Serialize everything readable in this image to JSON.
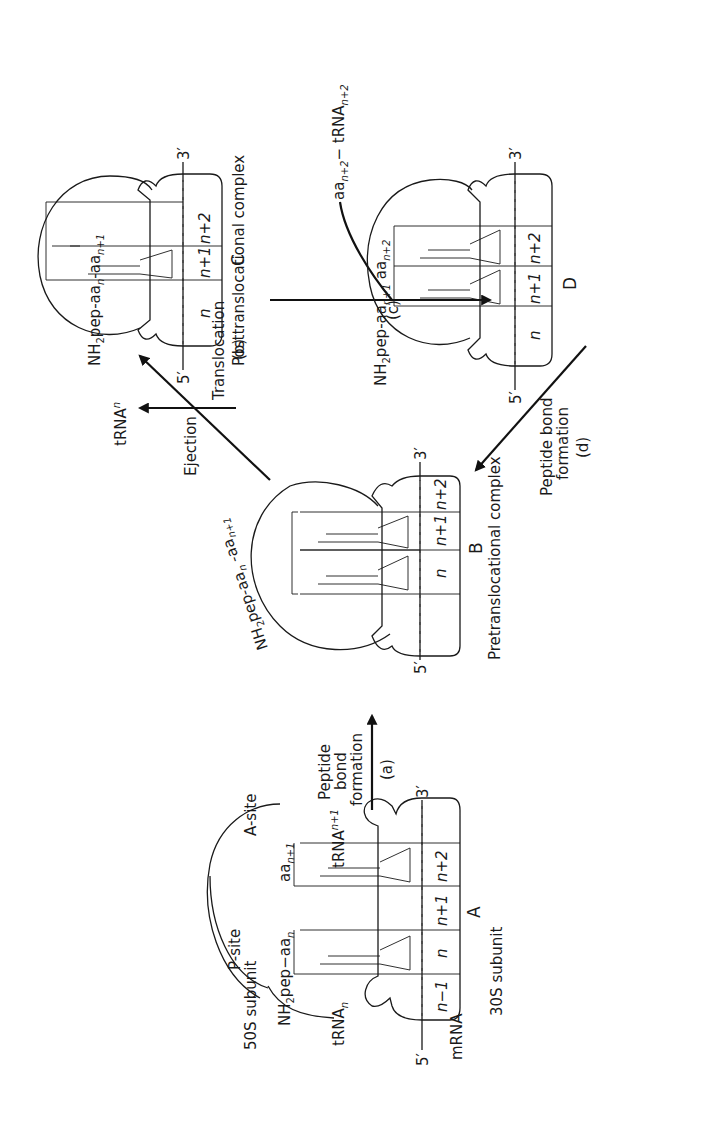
{
  "figure": {
    "orientation": "rotated 90 degrees counterclockwise"
  },
  "complex_a": {
    "id": "A",
    "subunit_large": "50S subunit",
    "subunit_small": "30S subunit",
    "p_site": "P-site",
    "a_site": "A-site",
    "peptide_prefix": "NH",
    "peptide_sub2": "2",
    "peptide_mid": "pep",
    "peptide_dash": "−",
    "aa_n": "aa",
    "aa_n_sub": "n",
    "aa_n1": "aa",
    "aa_n1_sub": "n+1",
    "trna_n": "tRNA",
    "trna_n_sub": "n",
    "trna_n1": "tRNA",
    "trna_n1_sub": "n+1",
    "mrna": "mRNA",
    "end5": "5′",
    "end3": "3′",
    "codons": [
      "n−1",
      "n",
      "n+1",
      "n+2"
    ]
  },
  "step_a": {
    "line1": "Peptide",
    "line2": "bond",
    "line3": "formation",
    "tag": "(a)"
  },
  "complex_b": {
    "id": "B",
    "caption": "Pretranslocational complex",
    "peptide_prefix": "NH",
    "peptide_sub2": "2",
    "peptide_mid": "pep-aa",
    "peptide_sub_n": "n",
    "peptide_tail": " -aa",
    "peptide_sub_n1": "n+1",
    "end5": "5′",
    "end3": "3′",
    "codons": [
      "n",
      "n+1",
      "n+2"
    ]
  },
  "step_b": {
    "ejection": "Ejection",
    "ejected": "tRNA",
    "ejected_sub": "n",
    "translocation": "Translocation",
    "tag": "(b)"
  },
  "complex_c": {
    "id": "C",
    "caption": "Posttranslocational complex",
    "peptide_prefix": "NH",
    "peptide_sub2": "2",
    "peptide_mid": "pep-aa",
    "peptide_sub_n": "n",
    "peptide_tail": "-aa",
    "peptide_sub_n1": "n+1",
    "end5": "5′",
    "end3": "3′",
    "codons": [
      "n",
      "n+1",
      "n+2"
    ]
  },
  "step_c": {
    "incoming": "aa",
    "incoming_sub": "n+2",
    "incoming_dash": "− tRNA",
    "incoming_sub2": "n+2",
    "tag": "(c)"
  },
  "complex_d": {
    "id": "D",
    "peptide_prefix": "NH",
    "peptide_sub2": "2",
    "peptide_mid": "pep-aa",
    "peptide_sub_n1": "n+1",
    "peptide_tail": " aa",
    "peptide_sub_n2": "n+2",
    "end5": "5′",
    "end3": "3′",
    "codons": [
      "n",
      "n+1",
      "n+2"
    ]
  },
  "step_d": {
    "line1": "Peptide bond",
    "line2": "formation",
    "tag": "(d)"
  },
  "colors": {
    "ink": "#1a1a1a",
    "background": "#ffffff"
  }
}
